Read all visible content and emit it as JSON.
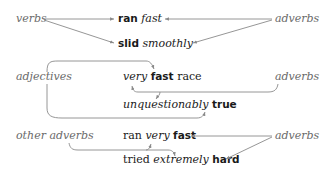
{
  "diagram": {
    "groups": [
      {
        "left_label": "verbs",
        "right_label": "adverbs",
        "phrases": [
          {
            "parts": [
              {
                "text": "ran",
                "style": "bold"
              },
              {
                "text": " "
              },
              {
                "text": "fast",
                "style": "italic"
              }
            ]
          },
          {
            "parts": [
              {
                "text": "slid",
                "style": "bold"
              },
              {
                "text": " "
              },
              {
                "text": "smoothly",
                "style": "italic"
              }
            ]
          }
        ]
      },
      {
        "left_label": "adjectives",
        "right_label": "adverbs",
        "phrases": [
          {
            "parts": [
              {
                "text": "very",
                "style": "italic"
              },
              {
                "text": " "
              },
              {
                "text": "fast",
                "style": "bold"
              },
              {
                "text": " race"
              }
            ]
          },
          {
            "parts": [
              {
                "text": "unquestionably",
                "style": "italic"
              },
              {
                "text": " "
              },
              {
                "text": "true",
                "style": "bold"
              }
            ]
          }
        ]
      },
      {
        "left_label": "other adverbs",
        "right_label": "adverbs",
        "phrases": [
          {
            "parts": [
              {
                "text": "ran "
              },
              {
                "text": "very",
                "style": "italic"
              },
              {
                "text": " "
              },
              {
                "text": "fast",
                "style": "bold"
              }
            ]
          },
          {
            "parts": [
              {
                "text": "tried "
              },
              {
                "text": "extremely",
                "style": "italic"
              },
              {
                "text": " "
              },
              {
                "text": "hard",
                "style": "bold"
              }
            ]
          }
        ]
      }
    ],
    "colors": {
      "label": "#6a6a6a",
      "text": "#1a1a1a",
      "arrow": "#8a8a8a"
    }
  }
}
